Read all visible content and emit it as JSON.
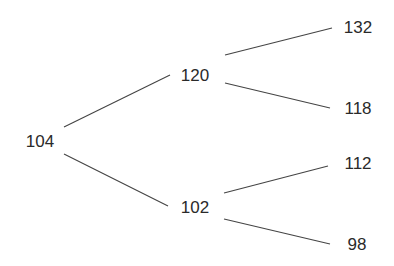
{
  "diagram": {
    "type": "binomial-tree",
    "nodes": [
      {
        "id": "root",
        "value": "104",
        "x": 40,
        "y": 141
      },
      {
        "id": "up",
        "value": "120",
        "x": 195,
        "y": 75
      },
      {
        "id": "down",
        "value": "102",
        "x": 195,
        "y": 207
      },
      {
        "id": "up-up",
        "value": "132",
        "x": 358,
        "y": 27
      },
      {
        "id": "up-down",
        "value": "118",
        "x": 358,
        "y": 108
      },
      {
        "id": "down-up",
        "value": "112",
        "x": 358,
        "y": 163
      },
      {
        "id": "down-down",
        "value": "98",
        "x": 357,
        "y": 244
      }
    ],
    "edges": [
      {
        "from": "root",
        "to": "up",
        "x1": 64,
        "y1": 127,
        "x2": 170,
        "y2": 75
      },
      {
        "from": "root",
        "to": "down",
        "x1": 64,
        "y1": 154,
        "x2": 168,
        "y2": 206
      },
      {
        "from": "up",
        "to": "up-up",
        "x1": 225,
        "y1": 55,
        "x2": 332,
        "y2": 28
      },
      {
        "from": "up",
        "to": "up-down",
        "x1": 225,
        "y1": 83,
        "x2": 330,
        "y2": 108
      },
      {
        "from": "down",
        "to": "down-up",
        "x1": 224,
        "y1": 193,
        "x2": 328,
        "y2": 166
      },
      {
        "from": "down",
        "to": "down-down",
        "x1": 224,
        "y1": 219,
        "x2": 330,
        "y2": 244
      }
    ]
  }
}
